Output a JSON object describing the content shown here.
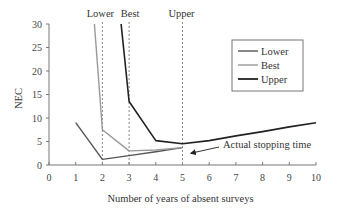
{
  "chart_data": {
    "type": "line",
    "title": "",
    "xlabel": "Number of years of absent surveys",
    "ylabel": "NEC",
    "xlim": [
      0,
      10
    ],
    "ylim": [
      0,
      30
    ],
    "x_ticks": [
      0,
      1,
      2,
      3,
      4,
      5,
      6,
      7,
      8,
      9,
      10
    ],
    "y_ticks": [
      0,
      5,
      10,
      15,
      20,
      25,
      30
    ],
    "grid": false,
    "legend_position": "upper right",
    "series": [
      {
        "name": "Lower",
        "color": "#555555",
        "points": [
          [
            1,
            9
          ],
          [
            2,
            1.2
          ],
          [
            3,
            2.0
          ],
          [
            4,
            2.8
          ],
          [
            5,
            3.7
          ]
        ]
      },
      {
        "name": "Best",
        "color": "#999999",
        "points": [
          [
            1.7,
            30
          ],
          [
            2,
            7.5
          ],
          [
            3,
            3.0
          ],
          [
            4,
            3.2
          ],
          [
            5,
            3.7
          ]
        ]
      },
      {
        "name": "Upper",
        "color": "#222222",
        "points": [
          [
            2.7,
            30
          ],
          [
            3,
            13.5
          ],
          [
            4,
            5.2
          ],
          [
            5,
            4.5
          ],
          [
            6,
            5.2
          ],
          [
            7,
            6.2
          ],
          [
            8,
            7.1
          ],
          [
            9,
            8.1
          ],
          [
            10,
            9.0
          ]
        ]
      }
    ],
    "vertical_markers": [
      {
        "x": 2,
        "label": "Lower"
      },
      {
        "x": 3,
        "label": "Best"
      },
      {
        "x": 5,
        "label": "Upper"
      }
    ],
    "annotations": [
      {
        "text": "Actual stopping time",
        "arrow_to": [
          5.2,
          2.5
        ]
      }
    ]
  }
}
